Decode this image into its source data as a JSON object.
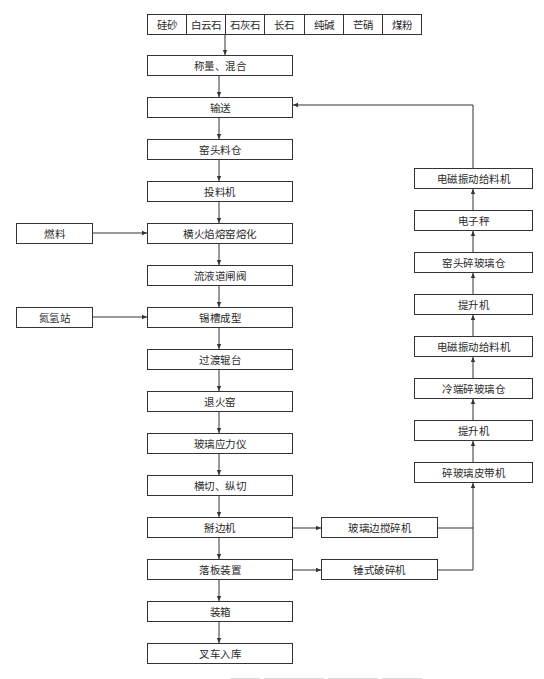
{
  "raw_materials": [
    "硅砂",
    "白云石",
    "石灰石",
    "长石",
    "纯碱",
    "芒硝",
    "煤粉"
  ],
  "main_flow": [
    "称量、混合",
    "输送",
    "窑头料仓",
    "投料机",
    "横火焰熔窑熔化",
    "流液道闸阀",
    "锡槽成型",
    "过渡辊台",
    "退火窑",
    "玻璃应力仪",
    "横切、纵切",
    "掰边机",
    "落板装置",
    "装箱",
    "叉车入库"
  ],
  "side_inputs": {
    "fuel": "燃料",
    "nitrogen_hydrogen_station": "氮氢站"
  },
  "crushers": {
    "edge_crusher": "玻璃边搅碎机",
    "hammer_crusher": "锤式破碎机"
  },
  "cullet_loop": [
    "电磁振动给料机",
    "电子秤",
    "窑头碎玻璃仓",
    "提升机",
    "电磁振动给料机",
    "冷端碎玻璃仓",
    "提升机",
    "碎玻璃皮带机"
  ],
  "colors": {
    "line": "#333333",
    "text": "#2a2a2a",
    "background": "#ffffff"
  }
}
